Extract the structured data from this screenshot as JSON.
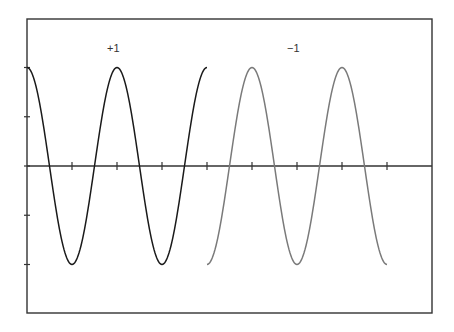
{
  "chart_data": {
    "type": "line",
    "title": "",
    "xlabel": "",
    "ylabel": "",
    "grid": false,
    "legend": "none",
    "annotations": [
      {
        "text": "+1",
        "x_px": 113,
        "y_px": 50,
        "series": "+1"
      },
      {
        "text": "−1",
        "x_px": 293,
        "y_px": 50,
        "series": "-1"
      }
    ],
    "xlim": [
      0,
      9
    ],
    "ylim": [
      -1.5,
      1.5
    ],
    "x_ticks": [
      0,
      1,
      2,
      3,
      4,
      5,
      6,
      7,
      8
    ],
    "y_ticks": [
      -1,
      -0.5,
      0,
      0.5,
      1
    ],
    "tick_labels_shown": false,
    "series": [
      {
        "name": "+1",
        "color": "#1a1a1a",
        "function": "cos(pi * x)",
        "x_range": [
          0,
          4
        ],
        "x": [
          0,
          0.5,
          1,
          1.5,
          2,
          2.5,
          3,
          3.5,
          4
        ],
        "y": [
          1,
          0,
          -1,
          0,
          1,
          0,
          -1,
          0,
          1
        ]
      },
      {
        "name": "-1",
        "color": "#7a7a7a",
        "function": "-cos(pi * x)",
        "x_range": [
          4,
          8
        ],
        "x": [
          4,
          4.5,
          5,
          5.5,
          6,
          6.5,
          7,
          7.5,
          8
        ],
        "y": [
          -1,
          0,
          1,
          0,
          -1,
          0,
          1,
          0,
          -1
        ]
      }
    ]
  },
  "layout": {
    "frame": {
      "left": 27,
      "top": 19,
      "right": 432,
      "bottom": 313
    },
    "x_px_per_unit": 45,
    "y_zero_px": 166,
    "y_px_per_unit": 98.5,
    "frame_color": "#333333",
    "axis_color": "#333333"
  }
}
